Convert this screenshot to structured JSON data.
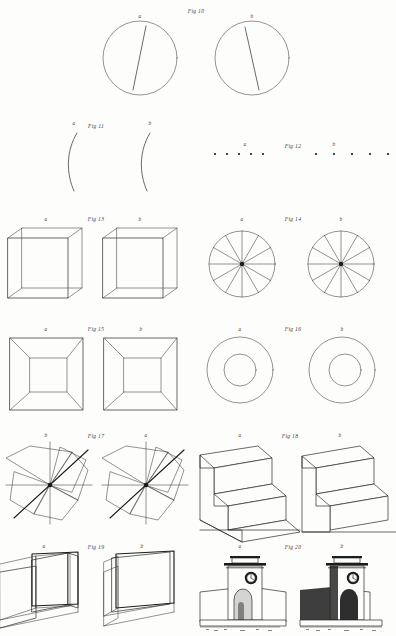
{
  "plate": {
    "title": "Stereoscopic Figures Plate",
    "background_color": "#fdfdfb",
    "ink_color": "#2a2a2a",
    "width": 396,
    "height": 636
  },
  "rows": [
    {
      "id": "row-fig10",
      "fig_label": "Fig 10",
      "fig_label_x": 196,
      "fig_label_y": 13,
      "subject": "circle-with-oblique-line",
      "panels": [
        {
          "key": "a",
          "label": "a",
          "label_x": 140,
          "label_y": 18,
          "cx": 140,
          "cy": 58,
          "r": 37
        },
        {
          "key": "b",
          "label": "b",
          "label_x": 252,
          "label_y": 18,
          "cx": 252,
          "cy": 58,
          "r": 37
        }
      ]
    },
    {
      "id": "row-fig11",
      "fig_label": "Fig 11",
      "fig_label_x": 96,
      "fig_label_y": 128,
      "subject": "single-arc",
      "panels": [
        {
          "key": "a",
          "label": "a",
          "label_x": 74,
          "label_y": 125
        },
        {
          "key": "b",
          "label": "b",
          "label_x": 150,
          "label_y": 125
        }
      ]
    },
    {
      "id": "row-fig12",
      "fig_label": "Fig 12",
      "fig_label_x": 293,
      "fig_label_y": 148,
      "subject": "row-of-dots",
      "panels": [
        {
          "key": "a",
          "label": "a",
          "label_x": 245,
          "label_y": 146,
          "dot_count": 5,
          "spacing": 12,
          "start_x": 215,
          "y": 154
        },
        {
          "key": "b",
          "label": "b",
          "label_x": 334,
          "label_y": 146,
          "dot_count": 5,
          "spacing": 18,
          "start_x": 316,
          "y": 154
        }
      ]
    },
    {
      "id": "row-fig13",
      "fig_label": "Fig 13",
      "fig_label_x": 96,
      "fig_label_y": 221,
      "subject": "wireframe-cube",
      "panels": [
        {
          "key": "a",
          "label": "a",
          "label_x": 46,
          "label_y": 221
        },
        {
          "key": "b",
          "label": "b",
          "label_x": 140,
          "label_y": 221
        }
      ]
    },
    {
      "id": "row-fig14",
      "fig_label": "Fig 14",
      "fig_label_x": 293,
      "fig_label_y": 221,
      "subject": "radial-spoked-wheel",
      "panels": [
        {
          "key": "a",
          "label": "a",
          "label_x": 242,
          "label_y": 221,
          "cx": 242,
          "cy": 264,
          "r": 33,
          "spokes": 12
        },
        {
          "key": "b",
          "label": "b",
          "label_x": 341,
          "label_y": 221,
          "cx": 341,
          "cy": 264,
          "r": 33,
          "spokes": 12
        }
      ]
    },
    {
      "id": "row-fig15",
      "fig_label": "Fig 15",
      "fig_label_x": 96,
      "fig_label_y": 331,
      "subject": "nested-square-frustum",
      "panels": [
        {
          "key": "a",
          "label": "a",
          "label_x": 46,
          "label_y": 331
        },
        {
          "key": "b",
          "label": "b",
          "label_x": 141,
          "label_y": 331
        }
      ]
    },
    {
      "id": "row-fig16",
      "fig_label": "Fig 16",
      "fig_label_x": 293,
      "fig_label_y": 331,
      "subject": "concentric-annulus",
      "panels": [
        {
          "key": "a",
          "label": "a",
          "label_x": 240,
          "label_y": 331,
          "cx": 240,
          "cy": 370,
          "r_outer": 33,
          "r_inner": 16
        },
        {
          "key": "b",
          "label": "b",
          "label_x": 342,
          "label_y": 331,
          "cx": 342,
          "cy": 370,
          "r_outer": 33,
          "r_inner": 16
        }
      ]
    },
    {
      "id": "row-fig17",
      "fig_label": "Fig 17",
      "fig_label_x": 96,
      "fig_label_y": 438,
      "subject": "pinwheel-vanes",
      "panels": [
        {
          "key": "b",
          "label": "b",
          "label_x": 46,
          "label_y": 437,
          "cx": 50,
          "cy": 485
        },
        {
          "key": "a",
          "label": "a",
          "label_x": 146,
          "label_y": 437,
          "cx": 146,
          "cy": 485
        }
      ]
    },
    {
      "id": "row-fig18",
      "fig_label": "Fig 18",
      "fig_label_x": 290,
      "fig_label_y": 438,
      "subject": "schroder-staircase",
      "panels": [
        {
          "key": "a",
          "label": "a",
          "label_x": 240,
          "label_y": 437
        },
        {
          "key": "b",
          "label": "b",
          "label_x": 340,
          "label_y": 437
        }
      ]
    },
    {
      "id": "row-fig19",
      "fig_label": "Fig 19",
      "fig_label_x": 96,
      "fig_label_y": 549,
      "subject": "folded-screen-panels",
      "panels": [
        {
          "key": "a",
          "label": "a",
          "label_x": 44,
          "label_y": 548
        },
        {
          "key": "b",
          "label": "b",
          "label_x": 142,
          "label_y": 548
        }
      ]
    },
    {
      "id": "row-fig20",
      "fig_label": "Fig 20",
      "fig_label_x": 293,
      "fig_label_y": 549,
      "subject": "archway-monument-with-clock",
      "panels": [
        {
          "key": "a",
          "label": "a",
          "label_x": 240,
          "label_y": 548
        },
        {
          "key": "b",
          "label": "b",
          "label_x": 342,
          "label_y": 548
        }
      ]
    }
  ]
}
